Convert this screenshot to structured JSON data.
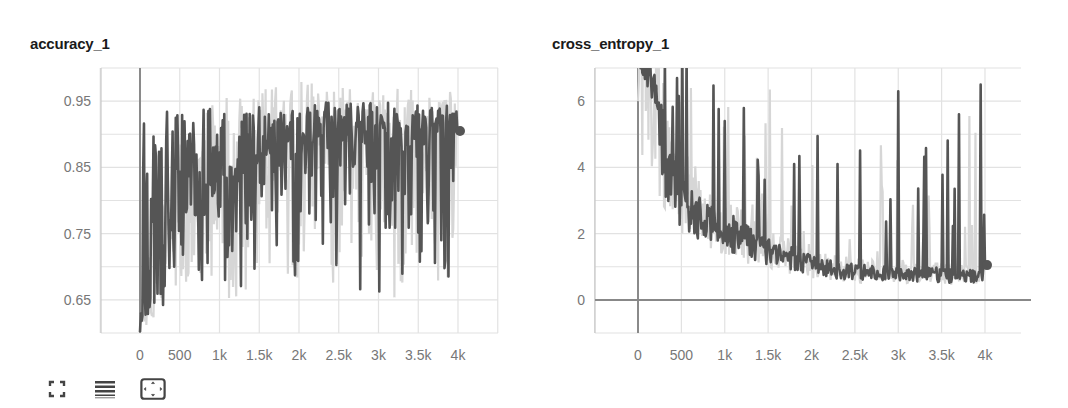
{
  "charts": [
    {
      "title": "accuracy_1",
      "y_ticks": [
        "0.95",
        "0.85",
        "0.75",
        "0.65"
      ],
      "x_ticks": [
        "0",
        "500",
        "1k",
        "1.5k",
        "2k",
        "2.5k",
        "3k",
        "3.5k",
        "4k"
      ]
    },
    {
      "title": "cross_entropy_1",
      "y_ticks": [
        "6",
        "4",
        "2",
        "0"
      ],
      "x_ticks": [
        "0",
        "500",
        "1k",
        "1.5k",
        "2k",
        "2.5k",
        "3k",
        "3.5k",
        "4k"
      ]
    }
  ],
  "toolbar": {
    "buttons": [
      {
        "icon": "expand-icon",
        "label": "Toggle fullscreen"
      },
      {
        "icon": "data-series-icon",
        "label": "Toggle log scale"
      },
      {
        "icon": "fit-domain-icon",
        "label": "Fit domain to data"
      }
    ]
  },
  "colors": {
    "smoothed_line": "#555555",
    "raw_line": "#d6d6d6",
    "grid": "#e2e2e2",
    "axis": "#8a8a8a",
    "zero_line": "#888888"
  },
  "chart_data": [
    {
      "type": "line",
      "title": "accuracy_1",
      "xlabel": "",
      "ylabel": "",
      "xlim": [
        -500,
        4500
      ],
      "ylim": [
        0.6,
        1.0
      ],
      "grid": true,
      "x_ticks": [
        0,
        500,
        1000,
        1500,
        2000,
        2500,
        3000,
        3500,
        4000
      ],
      "y_ticks": [
        0.65,
        0.75,
        0.85,
        0.95
      ],
      "legend": [],
      "series": [
        {
          "name": "smoothed",
          "x": [
            0,
            100,
            200,
            300,
            400,
            500,
            600,
            700,
            800,
            900,
            1000,
            1200,
            1400,
            1600,
            1800,
            2000,
            2200,
            2400,
            2600,
            2800,
            3000,
            3200,
            3400,
            3600,
            3800,
            3950,
            4000
          ],
          "values": [
            0.6,
            0.64,
            0.68,
            0.74,
            0.78,
            0.78,
            0.8,
            0.8,
            0.82,
            0.82,
            0.83,
            0.84,
            0.85,
            0.86,
            0.86,
            0.88,
            0.88,
            0.89,
            0.89,
            0.89,
            0.89,
            0.89,
            0.9,
            0.9,
            0.9,
            0.91,
            0.905
          ]
        },
        {
          "name": "raw",
          "x": [
            0,
            500,
            1000,
            1500,
            2000,
            2500,
            3000,
            3500,
            4000
          ],
          "values_range_low": [
            0.6,
            0.66,
            0.65,
            0.66,
            0.66,
            0.66,
            0.64,
            0.64,
            0.62
          ],
          "values_range_high": [
            0.66,
            0.9,
            0.96,
            0.97,
            0.98,
            0.97,
            0.97,
            0.98,
            0.96
          ]
        }
      ],
      "last_point": {
        "x": 4000,
        "y": 0.905
      }
    },
    {
      "type": "line",
      "title": "cross_entropy_1",
      "xlabel": "",
      "ylabel": "",
      "xlim": [
        -500,
        4500
      ],
      "ylim": [
        -1,
        7
      ],
      "grid": true,
      "x_ticks": [
        0,
        500,
        1000,
        1500,
        2000,
        2500,
        3000,
        3500,
        4000
      ],
      "y_ticks": [
        0,
        2,
        4,
        6
      ],
      "legend": [],
      "series": [
        {
          "name": "smoothed",
          "x": [
            0,
            100,
            200,
            300,
            400,
            500,
            600,
            700,
            800,
            1000,
            1200,
            1400,
            1600,
            1800,
            2000,
            2200,
            2400,
            2600,
            2800,
            3000,
            3200,
            3400,
            3600,
            3800,
            3950,
            4000
          ],
          "values": [
            7.0,
            6.5,
            5.5,
            4.2,
            3.4,
            3.0,
            2.8,
            2.5,
            2.2,
            2.0,
            1.8,
            1.5,
            1.3,
            1.2,
            1.0,
            0.9,
            0.85,
            0.8,
            0.8,
            0.8,
            0.75,
            0.75,
            0.7,
            0.7,
            0.65,
            1.05
          ]
        },
        {
          "name": "raw_spikes",
          "x": [
            450,
            1000,
            1800,
            2300,
            3000,
            3700,
            3950
          ],
          "values": [
            6.7,
            5.4,
            4.1,
            4.1,
            6.3,
            5.6,
            6.5
          ]
        }
      ],
      "last_point": {
        "x": 4000,
        "y": 1.05
      }
    }
  ]
}
